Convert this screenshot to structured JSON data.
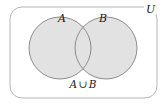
{
  "figure": {
    "kind": "venn-diagram",
    "title_caption": "A ∪ B",
    "universe_label": "U",
    "set_a_label": "A",
    "set_b_label": "B",
    "caption_parts": {
      "left_set": "A",
      "operator": "∪",
      "right_set": "B"
    },
    "colors": {
      "background": "#ffffff",
      "shaded_fill": "#e2e2e2",
      "circle_stroke": "#8c8c8c",
      "universe_stroke": "#b5b5b5",
      "text": "#1a1a1a"
    },
    "geometry": {
      "universe_rect": {
        "x": 10,
        "y": 7,
        "width": 147,
        "height": 91,
        "corner_radius": 12
      },
      "circle_a": {
        "cx": 60,
        "cy": 48,
        "r": 31
      },
      "circle_b": {
        "cx": 106,
        "cy": 48,
        "r": 31
      }
    },
    "shaded_region": "union"
  }
}
